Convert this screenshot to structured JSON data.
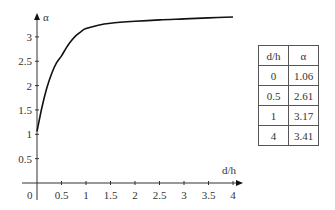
{
  "chart_data": {
    "type": "line",
    "title": "",
    "xlabel": "d/h",
    "ylabel": "α",
    "xlim": [
      0,
      4
    ],
    "ylim": [
      0,
      3.3
    ],
    "x_ticks": [
      "0",
      "0.5",
      "1",
      "1.5",
      "2",
      "2.5",
      "3",
      "3.5",
      "4"
    ],
    "y_ticks": [
      "0.5",
      "1",
      "1.5",
      "2",
      "2.5",
      "3"
    ],
    "grid": false,
    "series": [
      {
        "name": "α(d/h)",
        "x": [
          0,
          0.1,
          0.2,
          0.3,
          0.4,
          0.5,
          0.6,
          0.7,
          0.8,
          0.9,
          1.0,
          1.25,
          1.5,
          2,
          2.5,
          3,
          3.5,
          4
        ],
        "values": [
          1.06,
          1.55,
          1.95,
          2.25,
          2.47,
          2.61,
          2.78,
          2.92,
          3.03,
          3.11,
          3.17,
          3.24,
          3.28,
          3.32,
          3.35,
          3.37,
          3.39,
          3.41
        ]
      }
    ],
    "table": {
      "headers": [
        "d/h",
        "α"
      ],
      "rows": [
        [
          "0",
          "1.06"
        ],
        [
          "0.5",
          "2.61"
        ],
        [
          "1",
          "3.17"
        ],
        [
          "4",
          "3.41"
        ]
      ]
    }
  },
  "axis": {
    "x_label": "d/h",
    "y_label": "α",
    "origin": "0"
  },
  "table": {
    "headers": [
      "d/h",
      "α"
    ],
    "rows": [
      [
        "0",
        "1.06"
      ],
      [
        "0.5",
        "2.61"
      ],
      [
        "1",
        "3.17"
      ],
      [
        "4",
        "3.41"
      ]
    ]
  }
}
